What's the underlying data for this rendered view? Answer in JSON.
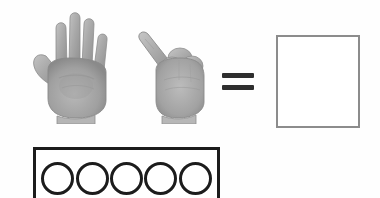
{
  "worksheet": {
    "type": "addition-with-hands",
    "background_color": "#fefefe",
    "equation": {
      "addend_one": {
        "icon": "open-hand-five-fingers-icon",
        "value": 5,
        "description": "Open palm showing five extended fingers",
        "color": "#a3a3a3"
      },
      "addend_two": {
        "icon": "fist-one-finger-icon",
        "value": 1,
        "description": "Closed fist with one digit extended",
        "color": "#a8a8a8"
      },
      "operator": {
        "icon": "equals-sign-icon",
        "symbol": "=",
        "color": "#2e2e2e"
      },
      "answer": {
        "icon": "empty-answer-box-icon",
        "value": "",
        "placeholder": "",
        "border_color": "#8c8c8c",
        "fill_color": "#ffffff"
      }
    },
    "counter_strip": {
      "icon": "counter-strip-icon",
      "border_color": "#1c1c1c",
      "fill_color": "#ffffff",
      "circle_count": 5,
      "circles": [
        {
          "label": "",
          "filled": false
        },
        {
          "label": "",
          "filled": false
        },
        {
          "label": "",
          "filled": false
        },
        {
          "label": "",
          "filled": false
        },
        {
          "label": "",
          "filled": false
        }
      ]
    }
  }
}
